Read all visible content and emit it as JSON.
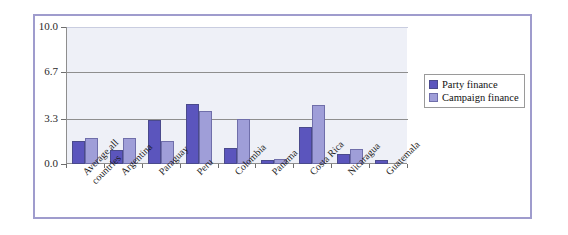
{
  "chart_data": {
    "type": "bar",
    "title": "",
    "xlabel": "",
    "ylabel": "",
    "ylim": [
      0,
      10
    ],
    "yticks": [
      "0.0",
      "3.3",
      "6.7",
      "10.0"
    ],
    "ytick_values": [
      0,
      3.3,
      6.7,
      10.0
    ],
    "grid": true,
    "legend_position": "right",
    "categories": [
      "Average all\ncountries",
      "Argentina",
      "Paraguay",
      "Peru",
      "Colombia",
      "Panama",
      "Costa Rica",
      "Nicaragua",
      "Guatemala"
    ],
    "series": [
      {
        "name": "Party finance",
        "color": "#5b55bd",
        "values": [
          1.7,
          1.0,
          3.2,
          4.4,
          1.2,
          0.3,
          2.7,
          0.7,
          0.3
        ]
      },
      {
        "name": "Campaign finance",
        "color": "#9f9ed8",
        "values": [
          1.9,
          1.9,
          1.7,
          3.9,
          3.3,
          0.4,
          4.3,
          1.1,
          0.0
        ]
      }
    ]
  },
  "legend": {
    "items": [
      {
        "label": "Party finance",
        "color": "#5b55bd"
      },
      {
        "label": "Campaign finance",
        "color": "#9f9ed8"
      }
    ]
  },
  "colors": {
    "frame": "#9f9ccd",
    "plot_background": "#eef0f7",
    "axis": "#8e8e8e"
  }
}
